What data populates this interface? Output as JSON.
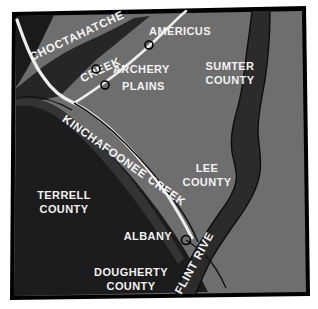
{
  "map": {
    "title": "Southwest Georgia Counties and Rivers Map",
    "frame": {
      "border_color": "#000000",
      "background_color": "#ffffff"
    },
    "colors": {
      "dark_region": "#1a1a1a",
      "mid_dark_region": "#2e2e2e",
      "light_region": "#6e6e6e",
      "river_fill": "#2b2b2b",
      "creek_stroke": "#e8e8e8",
      "boundary_stroke": "#101010",
      "label_text": "#f2f2f2",
      "marker_stroke": "#000000"
    },
    "counties": [
      {
        "id": "sumter",
        "name_line1": "SUMTER",
        "name_line2": "COUNTY",
        "x": 230,
        "y": 70,
        "shade": "light"
      },
      {
        "id": "lee",
        "name_line1": "LEE",
        "name_line2": "COUNTY",
        "x": 207,
        "y": 172,
        "shade": "light"
      },
      {
        "id": "terrell",
        "name_line1": "TERRELL",
        "name_line2": "COUNTY",
        "x": 64,
        "y": 199,
        "shade": "dark"
      },
      {
        "id": "dougherty",
        "name_line1": "DOUGHERTY",
        "name_line2": "COUNTY",
        "x": 131,
        "y": 276,
        "shade": "dark"
      }
    ],
    "cities": [
      {
        "id": "americus",
        "label": "AMERICUS",
        "label_x": 180,
        "label_y": 35,
        "marker_x": 149,
        "marker_y": 45
      },
      {
        "id": "archery",
        "label": "ARCHERY",
        "label_x": 113,
        "label_y": 73,
        "marker_x": 96,
        "marker_y": 69
      },
      {
        "id": "plains",
        "label": "PLAINS",
        "label_x": 122,
        "label_y": 90,
        "marker_x": 105,
        "marker_y": 85
      },
      {
        "id": "albany",
        "label": "ALBANY",
        "label_x": 140,
        "label_y": 240,
        "marker_x": 186,
        "marker_y": 240
      }
    ],
    "waterways": [
      {
        "id": "choctahatchee-creek",
        "name_part1": "CHOCTAHATCHEE",
        "name_part2": "CREEK",
        "type": "creek"
      },
      {
        "id": "kinchafoonee-creek",
        "name": "KINCHAFOONEE CREEK",
        "type": "creek"
      },
      {
        "id": "flint-river",
        "name": "FLINT RIVER",
        "type": "river"
      }
    ]
  }
}
